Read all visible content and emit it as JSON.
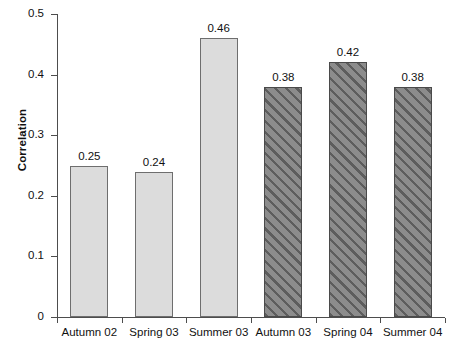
{
  "chart_data": {
    "type": "bar",
    "title": "",
    "xlabel": "",
    "ylabel": "Correlation",
    "categories": [
      "Autumn 02",
      "Spring 03",
      "Summer 03",
      "Autumn 03",
      "Spring 04",
      "Summer 04"
    ],
    "values": [
      0.25,
      0.24,
      0.46,
      0.38,
      0.42,
      0.38
    ],
    "value_labels": [
      "0.25",
      "0.24",
      "0.46",
      "0.38",
      "0.42",
      "0.38"
    ],
    "series": [
      {
        "name": "Correlation",
        "values": [
          0.25,
          0.24,
          0.46,
          0.38,
          0.42,
          0.38
        ],
        "styles": [
          "plain",
          "plain",
          "plain",
          "hatched",
          "hatched",
          "hatched"
        ]
      }
    ],
    "ylim": [
      0,
      0.5
    ],
    "ytick_values": [
      0,
      0.1,
      0.2,
      0.3,
      0.4,
      0.5
    ],
    "ytick_labels": [
      "0",
      "0.1",
      "0.2",
      "0.3",
      "0.4",
      "0.5"
    ],
    "grid": false,
    "legend": "none",
    "colors": {
      "plain_fill": "#dcdcdc",
      "plain_edge": "#6e6e6e",
      "hatched_fill": "#8c8c8c",
      "hatch_line": "#5d5d5d",
      "hatched_edge": "#4a4a4a",
      "axis": "#4d4d4d",
      "text": "#111111",
      "background": "#ffffff"
    }
  }
}
